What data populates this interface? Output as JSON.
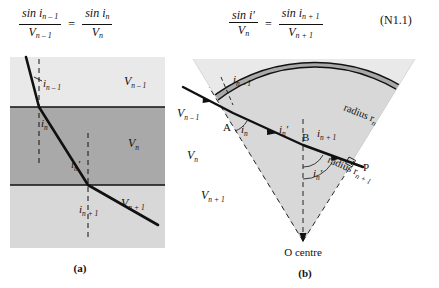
{
  "equations": {
    "left": {
      "lhs_num": "sin i",
      "lhs_num_sub": "n – 1",
      "lhs_den": "V",
      "lhs_den_sub": "n – 1",
      "relation": "=",
      "rhs_num": "sin i",
      "rhs_num_sub": "n",
      "rhs_den": "V",
      "rhs_den_sub": "n"
    },
    "right": {
      "lhs_num": "sin i′",
      "lhs_den": "V",
      "lhs_den_sub": "n",
      "relation": "=",
      "rhs_num": "sin i",
      "rhs_num_sub": "n + 1",
      "rhs_den": "V",
      "rhs_den_sub": "n + 1"
    },
    "number": "(N1.1)"
  },
  "panel_a": {
    "caption": "(a)",
    "layers": [
      {
        "velocity": "V",
        "velocity_sub": "n – 1",
        "fill": "#e9e9e9"
      },
      {
        "velocity": "V",
        "velocity_sub": "n",
        "fill": "#a9a9a9"
      },
      {
        "velocity": "V",
        "velocity_sub": "n + 1",
        "fill": "#d8d8d8"
      }
    ],
    "angles": [
      {
        "symbol": "i",
        "sub": "n – 1"
      },
      {
        "symbol": "i",
        "sub": "n"
      },
      {
        "symbol": "i",
        "sub": "n",
        "prime": "′"
      },
      {
        "symbol": "i",
        "sub": "n + 1"
      }
    ]
  },
  "panel_b": {
    "caption": "(b)",
    "layers": [
      {
        "velocity": "V",
        "velocity_sub": "n – 1",
        "fill": "#e9e9e9"
      },
      {
        "velocity": "V",
        "velocity_sub": "n",
        "fill": "#a9a9a9"
      },
      {
        "velocity": "V",
        "velocity_sub": "n + 1",
        "fill": "#d8d8d8"
      }
    ],
    "arcs": [
      {
        "label": "radius r",
        "label_sub": "n"
      },
      {
        "label": "radius r",
        "label_sub": "n + 1"
      }
    ],
    "points": [
      {
        "name": "A"
      },
      {
        "name": "B"
      },
      {
        "name": "P"
      },
      {
        "name": "O",
        "annotation": "centre"
      }
    ],
    "angles": [
      {
        "symbol": "i",
        "sub": "n – 1"
      },
      {
        "symbol": "i",
        "sub": "n"
      },
      {
        "symbol": "i",
        "sub": "n",
        "prime": "′"
      },
      {
        "symbol": "i",
        "sub": "n + 1"
      },
      {
        "symbol": "i",
        "sub": "n",
        "prime": "′"
      }
    ],
    "centre_label": "O  centre"
  },
  "colors": {
    "ink": "#111111",
    "layer_light": "#e9e9e9",
    "layer_mid": "#a9a9a9",
    "layer_lower": "#d8d8d8",
    "background": "#ffffff"
  }
}
